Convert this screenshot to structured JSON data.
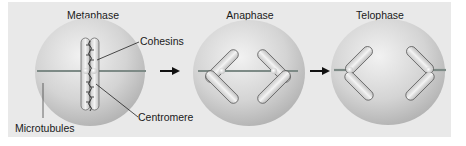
{
  "diagram": {
    "stages": [
      {
        "name": "Metaphase"
      },
      {
        "name": "Anaphase"
      },
      {
        "name": "Telophase"
      }
    ],
    "callouts": {
      "cohesins": "Cohesins",
      "centromere": "Centromere",
      "microtubules": "Microtubules"
    },
    "colors": {
      "background": "#e9e9e9",
      "cell": "#c8c8c8",
      "chromosome": "#d8d8d8",
      "microtubule": "#7d8a86",
      "arrow": "#111111"
    }
  }
}
